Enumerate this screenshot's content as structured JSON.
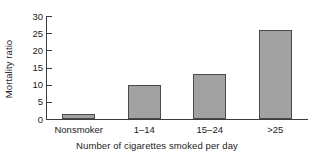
{
  "chart_data": {
    "type": "bar",
    "title": "",
    "xlabel": "Number of cigarettes smoked per day",
    "ylabel": "Mortality ratio",
    "categories": [
      "Nonsmoker",
      "1–14",
      "15–24",
      ">25"
    ],
    "values": [
      1.5,
      10,
      13,
      26
    ],
    "ylim": [
      0,
      30
    ],
    "yticks": [
      0,
      5,
      10,
      15,
      20,
      25,
      30
    ],
    "ytick_labels": [
      "0",
      "5",
      "10",
      "15",
      "20",
      "25",
      "30"
    ],
    "grid": false,
    "legend": null,
    "series": [
      {
        "name": "Mortality ratio",
        "values": [
          1.5,
          10,
          13,
          26
        ]
      }
    ],
    "colors": {
      "bar_fill": "#a2a2a2",
      "bar_border": "#4a4a4a",
      "axis": "#3c3c3c",
      "text": "#1a1a1a",
      "background": "#ffffff"
    }
  }
}
